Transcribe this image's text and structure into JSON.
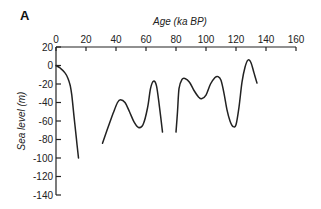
{
  "panel_label": "A",
  "chart_data": {
    "type": "line",
    "title": "",
    "xlabel": "Age (ka BP)",
    "ylabel": "Sea level (m)",
    "xlim": [
      0,
      160
    ],
    "ylim": [
      -140,
      20
    ],
    "x_ticks": [
      0,
      20,
      40,
      60,
      80,
      100,
      120,
      140,
      160
    ],
    "y_ticks": [
      20,
      0,
      -20,
      -40,
      -60,
      -80,
      -100,
      -120,
      -140
    ],
    "x_axis_position": "top",
    "grid": false,
    "legend": null,
    "series": [
      {
        "name": "segment-1",
        "x": [
          0,
          3,
          6,
          8,
          9.5,
          10.5,
          12,
          13.5,
          15
        ],
        "y": [
          0,
          -3,
          -8,
          -14,
          -22,
          -32,
          -55,
          -78,
          -100
        ]
      },
      {
        "name": "segment-2",
        "x": [
          31,
          34,
          38,
          41,
          43,
          46,
          49,
          52,
          55,
          58,
          61,
          63,
          65,
          67,
          69,
          71
        ],
        "y": [
          -84,
          -70,
          -52,
          -40,
          -37,
          -40,
          -50,
          -61,
          -67,
          -64,
          -46,
          -25,
          -17,
          -22,
          -45,
          -72
        ]
      },
      {
        "name": "segment-3",
        "x": [
          80,
          81,
          82,
          84,
          86,
          89,
          92,
          95,
          97,
          100,
          103,
          106,
          108,
          110,
          112,
          114,
          116,
          118,
          120,
          122,
          124,
          126,
          128,
          130,
          132,
          134
        ],
        "y": [
          -72,
          -50,
          -25,
          -15,
          -14,
          -18,
          -27,
          -34,
          -36,
          -32,
          -20,
          -13,
          -12,
          -16,
          -30,
          -48,
          -60,
          -66,
          -64,
          -45,
          -18,
          -2,
          6,
          3,
          -8,
          -19
        ]
      }
    ]
  }
}
